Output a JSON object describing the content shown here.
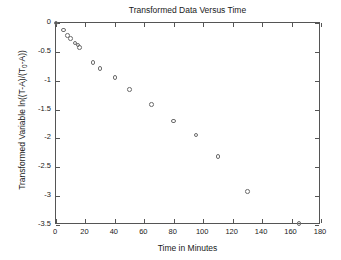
{
  "chart_data": {
    "type": "scatter",
    "title": "Transformed Data Versus Time",
    "xlabel": "Time in Minutes",
    "ylabel": "Transformed Variable ln((T-A)/(T₀-A))",
    "ylabel_parts": {
      "prefix": "Transformed Variable ln((T-A)/(T",
      "subscript": "0",
      "suffix": "-A))"
    },
    "xlim": [
      0,
      180
    ],
    "ylim": [
      -3.5,
      0
    ],
    "xticks": [
      0,
      20,
      40,
      60,
      80,
      100,
      120,
      140,
      160,
      180
    ],
    "xticklabels": [
      "0",
      "20",
      "40",
      "60",
      "80",
      "100",
      "120",
      "140",
      "160",
      "180"
    ],
    "yticks": [
      0,
      -0.5,
      -1,
      -1.5,
      -2,
      -2.5,
      -3,
      -3.5
    ],
    "yticklabels": [
      "0",
      "-0.5",
      "-1",
      "-1.5",
      "-2",
      "-2.5",
      "-3",
      "-3.5"
    ],
    "grid": false,
    "legend": false,
    "marker": "open-circle",
    "marker_color": "#6b6b6b",
    "axis_color": "#555555",
    "background": "#ffffff",
    "x": [
      0,
      5,
      8,
      10,
      13,
      15,
      16,
      25,
      30,
      40,
      50,
      65,
      80,
      95,
      110,
      130,
      165
    ],
    "y": [
      0,
      -0.12,
      -0.22,
      -0.27,
      -0.35,
      -0.38,
      -0.42,
      -0.68,
      -0.79,
      -0.94,
      -1.15,
      -1.41,
      -1.7,
      -1.94,
      -2.31,
      -2.92,
      -3.47
    ],
    "points": [
      {
        "x": 0,
        "y": 0.0
      },
      {
        "x": 5,
        "y": -0.12
      },
      {
        "x": 8,
        "y": -0.22
      },
      {
        "x": 10,
        "y": -0.27
      },
      {
        "x": 13,
        "y": -0.35
      },
      {
        "x": 15,
        "y": -0.38
      },
      {
        "x": 16,
        "y": -0.42
      },
      {
        "x": 25,
        "y": -0.68
      },
      {
        "x": 30,
        "y": -0.79
      },
      {
        "x": 40,
        "y": -0.94
      },
      {
        "x": 50,
        "y": -1.15
      },
      {
        "x": 65,
        "y": -1.41
      },
      {
        "x": 80,
        "y": -1.7
      },
      {
        "x": 95,
        "y": -1.94
      },
      {
        "x": 110,
        "y": -2.31
      },
      {
        "x": 130,
        "y": -2.92
      },
      {
        "x": 165,
        "y": -3.47
      }
    ]
  }
}
